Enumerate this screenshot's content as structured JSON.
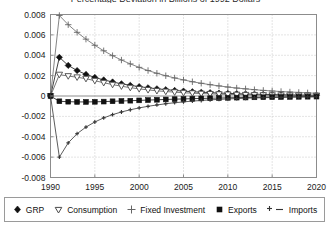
{
  "chart_data": {
    "type": "line",
    "title": "Percentage Deviation in Billions of 1992 Dollars",
    "xlabel": "",
    "ylabel": "",
    "xlim": [
      1990,
      2020
    ],
    "ylim": [
      -0.008,
      0.008
    ],
    "xticks": [
      "1990",
      "1995",
      "2000",
      "2005",
      "2010",
      "2015",
      "2020"
    ],
    "yticks": [
      "0.008",
      "0.006",
      "0.004",
      "0.002",
      "0",
      "-0.002",
      "-0.004",
      "-0.006",
      "-0.008"
    ],
    "grid": true,
    "legend_position": "bottom",
    "x": [
      1990,
      1991,
      1992,
      1993,
      1994,
      1995,
      1996,
      1997,
      1998,
      1999,
      2000,
      2001,
      2002,
      2003,
      2004,
      2005,
      2006,
      2007,
      2008,
      2009,
      2010,
      2011,
      2012,
      2013,
      2014,
      2015,
      2016,
      2017,
      2018,
      2019,
      2020
    ],
    "series": [
      {
        "name": "GRP",
        "marker": "filled-diamond",
        "color": "#111111",
        "values": [
          0.0,
          0.0038,
          0.003,
          0.0025,
          0.00212,
          0.00182,
          0.00158,
          0.00138,
          0.0012,
          0.00105,
          0.00092,
          0.00081,
          0.00071,
          0.00062,
          0.00055,
          0.00048,
          0.00042,
          0.00037,
          0.00033,
          0.00029,
          0.00026,
          0.00023,
          0.0002,
          0.00018,
          0.00016,
          0.00014,
          0.00012,
          0.00011,
          0.0001,
          9e-05,
          8e-05
        ]
      },
      {
        "name": "Consumption",
        "marker": "open-triangle-down",
        "color": "#555555",
        "values": [
          0.0,
          0.0021,
          0.00196,
          0.00184,
          0.0017,
          0.0015,
          0.0013,
          0.00112,
          0.00096,
          0.00082,
          0.0007,
          0.0006,
          0.00051,
          0.00044,
          0.00038,
          0.00032,
          0.00028,
          0.00024,
          0.00021,
          0.00018,
          0.00016,
          0.00014,
          0.00012,
          0.0001,
          9e-05,
          8e-05,
          7e-05,
          6e-05,
          5e-05,
          5e-05,
          4e-05
        ]
      },
      {
        "name": "Fixed Investment",
        "marker": "plus",
        "color": "#666666",
        "values": [
          0.0,
          0.0079,
          0.007,
          0.00625,
          0.00558,
          0.00498,
          0.00444,
          0.00396,
          0.00353,
          0.00315,
          0.00281,
          0.0025,
          0.00223,
          0.00199,
          0.00177,
          0.00158,
          0.0014,
          0.00125,
          0.00111,
          0.00099,
          0.00088,
          0.00078,
          0.0007,
          0.00062,
          0.00055,
          0.00049,
          0.00044,
          0.00039,
          0.00035,
          0.00031,
          0.00027
        ]
      },
      {
        "name": "Exports",
        "marker": "filled-square",
        "color": "#111111",
        "values": [
          0.0,
          -0.00052,
          -0.00056,
          -0.00058,
          -0.00058,
          -0.00057,
          -0.00055,
          -0.00052,
          -0.00049,
          -0.00046,
          -0.00043,
          -0.0004,
          -0.00037,
          -0.00034,
          -0.00031,
          -0.00029,
          -0.00026,
          -0.00024,
          -0.00022,
          -0.0002,
          -0.00018,
          -0.00016,
          -0.00015,
          -0.00013,
          -0.00012,
          -0.00011,
          -0.0001,
          -9e-05,
          -8e-05,
          -7e-05,
          -6e-05
        ]
      },
      {
        "name": "Imports",
        "marker": "small-plus",
        "color": "#333333",
        "values": [
          0.0,
          -0.006,
          -0.0046,
          -0.0037,
          -0.00305,
          -0.00255,
          -0.00215,
          -0.00183,
          -0.00157,
          -0.00135,
          -0.00117,
          -0.00101,
          -0.00088,
          -0.00076,
          -0.00066,
          -0.00058,
          -0.0005,
          -0.00044,
          -0.00038,
          -0.00033,
          -0.00029,
          -0.00025,
          -0.00022,
          -0.00019,
          -0.00017,
          -0.00015,
          -0.00013,
          -0.00011,
          -0.0001,
          -9e-05,
          -8e-05
        ]
      }
    ]
  },
  "legend": {
    "items": [
      {
        "label": "GRP",
        "marker": "filled-diamond"
      },
      {
        "label": "Consumption",
        "marker": "open-triangle-down"
      },
      {
        "label": "Fixed Investment",
        "marker": "plus"
      },
      {
        "label": "Exports",
        "marker": "filled-square"
      },
      {
        "label": "Imports",
        "marker": "small-plus-dash"
      }
    ]
  },
  "colors": {
    "axis": "#8c8c8c",
    "grid": "#c8c8c8",
    "text": "#111111",
    "background": "#ffffff"
  }
}
